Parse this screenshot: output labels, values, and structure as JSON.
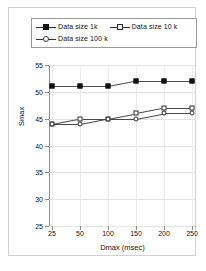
{
  "chart_data": {
    "type": "line",
    "title": "",
    "xlabel": "Dmax (msec)",
    "ylabel": "Smax",
    "categories": [
      25,
      50,
      100,
      150,
      200,
      250
    ],
    "xtick_labels": [
      "25",
      "50",
      "100",
      "150",
      "200",
      "250"
    ],
    "ytick_labels": [
      "25",
      "30",
      "35",
      "40",
      "45",
      "50",
      "55"
    ],
    "yticks": [
      25,
      30,
      35,
      40,
      45,
      50,
      55
    ],
    "ylim": [
      25,
      55
    ],
    "grid": true,
    "legend_position": "top",
    "series": [
      {
        "name": "Data size 1k",
        "marker": "filled-square",
        "values": [
          51,
          51,
          51,
          52,
          52,
          52
        ]
      },
      {
        "name": "Data size 10 k",
        "marker": "open-square",
        "values": [
          44,
          45,
          45,
          46,
          47,
          47
        ]
      },
      {
        "name": "Data size 100 k",
        "marker": "open-circle",
        "values": [
          44,
          44,
          45,
          45,
          46,
          46
        ]
      }
    ],
    "colors": {
      "line": "#4a4a4a",
      "marker_fill": "#111111",
      "marker_edge": "#2b2b2b",
      "grid": "#e3e3e3",
      "axis": "#8c8c8c",
      "background": "#ffffff",
      "frame": "#d2d2d2"
    }
  }
}
